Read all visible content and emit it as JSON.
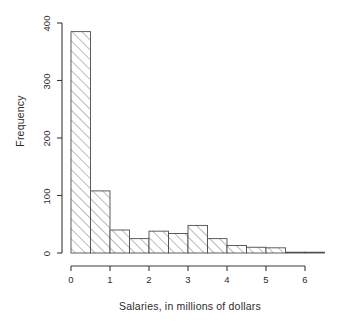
{
  "chart_data": {
    "type": "bar",
    "title": "",
    "subtitle": "",
    "xlabel": "Salaries, in millions of dollars",
    "ylabel": "Frequency",
    "xlim": [
      0,
      6.5
    ],
    "ylim": [
      0,
      400
    ],
    "xticks": [
      0,
      1,
      2,
      3,
      4,
      5,
      6
    ],
    "xtick_labels": [
      "0",
      "1",
      "2",
      "3",
      "4",
      "5",
      "6"
    ],
    "yticks": [
      0,
      100,
      200,
      300,
      400
    ],
    "ytick_labels": [
      "0",
      "100",
      "200",
      "300",
      "400"
    ],
    "grid": false,
    "legend": null,
    "bin_width": 0.5,
    "bin_edges": [
      0,
      0.5,
      1.0,
      1.5,
      2.0,
      2.5,
      3.0,
      3.5,
      4.0,
      4.5,
      5.0,
      5.5,
      6.0,
      6.5
    ],
    "categories": [
      "0-0.5",
      "0.5-1",
      "1-1.5",
      "1.5-2",
      "2-2.5",
      "2.5-3",
      "3-3.5",
      "3.5-4",
      "4-4.5",
      "4.5-5",
      "5-5.5",
      "5.5-6",
      "6-6.5"
    ],
    "values": [
      385,
      108,
      40,
      25,
      38,
      34,
      48,
      25,
      13,
      10,
      9,
      1,
      1
    ],
    "bar_fill": "#ffffff",
    "bar_edge": "#4d4d4d",
    "hatch": "/",
    "axis_color": "#3a3a3a"
  },
  "figure": {
    "axis_label_x": "Salaries, in millions of dollars",
    "axis_label_y": "Frequency"
  }
}
